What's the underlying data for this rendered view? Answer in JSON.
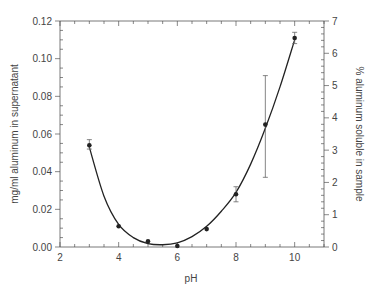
{
  "chart_data": {
    "type": "scatter",
    "title": "",
    "xlabel": "pH",
    "ylabel": "mg/ml aluminum in supernatant",
    "ylabel_right": "% aluminum soluble in sample",
    "xlim": [
      2,
      11
    ],
    "ylim": [
      0,
      0.12
    ],
    "ylim_right": [
      0,
      7
    ],
    "grid": false,
    "legend": null,
    "x_ticks": [
      2,
      4,
      6,
      8,
      10
    ],
    "x_tick_labels": [
      "2",
      "4",
      "6",
      "8",
      "10"
    ],
    "y_ticks": [
      0,
      0.02,
      0.04,
      0.06,
      0.08,
      0.1,
      0.12
    ],
    "y_tick_labels": [
      "0.00",
      "0.02",
      "0.04",
      "0.06",
      "0.08",
      "0.10",
      "0.12"
    ],
    "y_right_ticks": [
      0,
      1,
      2,
      3,
      4,
      5,
      6,
      7
    ],
    "y_right_tick_labels": [
      "0",
      "1",
      "2",
      "3",
      "4",
      "5",
      "6",
      "7"
    ],
    "series": [
      {
        "name": "Measured",
        "x": [
          3,
          4,
          5,
          6,
          7,
          8,
          9,
          10
        ],
        "y": [
          0.054,
          0.011,
          0.003,
          0.0005,
          0.0095,
          0.028,
          0.065,
          0.111
        ],
        "err_low": [
          0.052,
          0.011,
          0.003,
          0.0005,
          0.0095,
          0.024,
          0.037,
          0.108
        ],
        "err_high": [
          0.057,
          0.011,
          0.003,
          0.0005,
          0.0095,
          0.032,
          0.091,
          0.114
        ]
      }
    ],
    "fit_curve": {
      "name": "Fitted curve",
      "x": [
        3,
        3.5,
        4,
        4.5,
        5,
        5.5,
        6,
        6.5,
        7,
        7.5,
        8,
        8.5,
        9,
        9.5,
        10
      ],
      "y": [
        0.053,
        0.027,
        0.012,
        0.005,
        0.0018,
        0.0012,
        0.0022,
        0.0055,
        0.011,
        0.019,
        0.029,
        0.044,
        0.063,
        0.085,
        0.11
      ]
    }
  }
}
